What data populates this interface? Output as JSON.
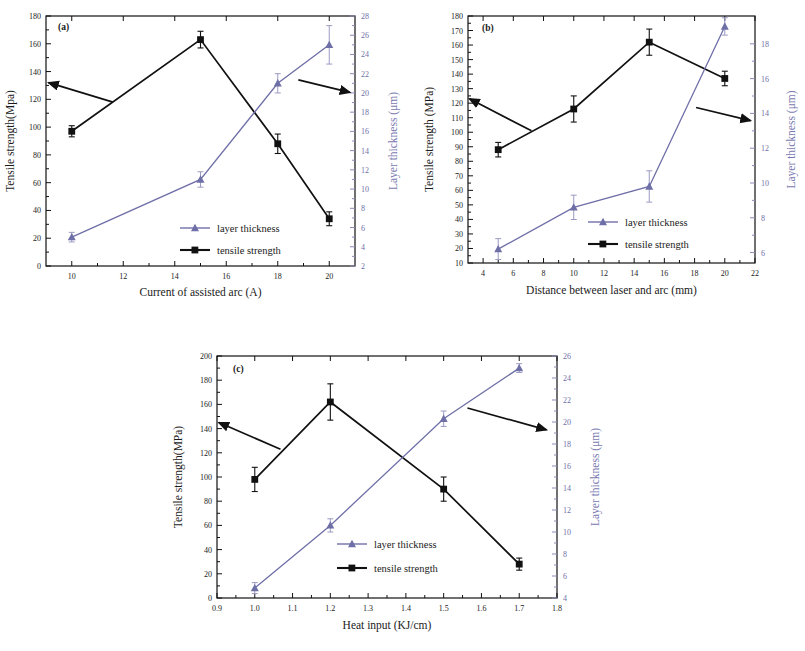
{
  "figure": {
    "panels": [
      "a",
      "b",
      "c"
    ],
    "series_colors": {
      "tensile_strength": "#111111",
      "layer_thickness": "#6f6fa8"
    },
    "legend": {
      "thickness_label": "layer thickness",
      "strength_label": "tensile strength"
    }
  },
  "chart_data": [
    {
      "type": "line",
      "panel_tag": "(a)",
      "title": "",
      "xlabel": "Current of assisted arc (A)",
      "ylabel": "Tensile strength(Mpa)",
      "ylabel_right": "Layer thickness (μm)",
      "xlim": [
        9,
        21
      ],
      "ylim": [
        0,
        180
      ],
      "ylim_right": [
        2,
        28
      ],
      "xticks": [
        10,
        12,
        14,
        16,
        18,
        20
      ],
      "xtick_labels": [
        "10",
        "12",
        "14",
        "16",
        "18",
        "20"
      ],
      "yticks": [
        0,
        20,
        40,
        60,
        80,
        100,
        120,
        140,
        160,
        180
      ],
      "ytick_labels": [
        "0",
        "20",
        "40",
        "60",
        "80",
        "100",
        "120",
        "140",
        "160",
        "180"
      ],
      "yticks_right": [
        2,
        4,
        6,
        8,
        10,
        12,
        14,
        16,
        18,
        20,
        22,
        24,
        26,
        28
      ],
      "ytick_labels_right": [
        "2",
        "4",
        "6",
        "8",
        "10",
        "12",
        "14",
        "16",
        "18",
        "20",
        "22",
        "24",
        "26",
        "28"
      ],
      "grid": false,
      "legend_position": "lower-center-right",
      "x": [
        10,
        15,
        18,
        20
      ],
      "series": [
        {
          "name": "tensile strength",
          "axis": "left",
          "values": [
            97,
            163,
            88,
            34
          ],
          "errors": [
            4,
            6,
            7,
            5
          ]
        },
        {
          "name": "layer thickness",
          "axis": "right",
          "values": [
            5.0,
            11.0,
            21.0,
            25.0
          ],
          "errors": [
            0.5,
            0.8,
            1.0,
            2.0
          ]
        }
      ],
      "annotations": [
        {
          "type": "arrow",
          "points_to": "left-axis",
          "x_from": 11.6,
          "y_from": 118,
          "x_to": 9.1,
          "y_to": 132
        },
        {
          "type": "arrow",
          "points_to": "right-axis",
          "x_from": 18.8,
          "y_from": 134,
          "x_to": 20.8,
          "y_to": 125
        }
      ]
    },
    {
      "type": "line",
      "panel_tag": "(b)",
      "title": "",
      "xlabel": "Distance between laser and arc (mm)",
      "ylabel": "Tensile strength (MPa)",
      "ylabel_right": "Layer thickness (μm)",
      "xlim": [
        3,
        22
      ],
      "ylim": [
        10,
        180
      ],
      "ylim_right": [
        5.4,
        19.6
      ],
      "xticks": [
        4,
        6,
        8,
        10,
        12,
        14,
        16,
        18,
        20,
        22
      ],
      "xtick_labels": [
        "4",
        "6",
        "8",
        "10",
        "12",
        "14",
        "16",
        "18",
        "20",
        "22"
      ],
      "yticks": [
        10,
        20,
        30,
        40,
        50,
        60,
        70,
        80,
        90,
        100,
        110,
        120,
        130,
        140,
        150,
        160,
        170,
        180
      ],
      "ytick_labels": [
        "10",
        "20",
        "30",
        "40",
        "50",
        "60",
        "70",
        "80",
        "90",
        "100",
        "110",
        "120",
        "130",
        "140",
        "150",
        "160",
        "170",
        "180"
      ],
      "yticks_right": [
        6,
        8,
        10,
        12,
        14,
        16,
        18
      ],
      "ytick_labels_right": [
        "6",
        "8",
        "10",
        "12",
        "14",
        "16",
        "18"
      ],
      "grid": false,
      "legend_position": "lower-center-right",
      "x": [
        5,
        10,
        15,
        20
      ],
      "series": [
        {
          "name": "tensile strength",
          "axis": "left",
          "values": [
            88,
            116,
            162,
            137
          ],
          "errors": [
            5,
            9,
            9,
            5
          ]
        },
        {
          "name": "layer thickness",
          "axis": "right",
          "values": [
            6.2,
            8.6,
            9.8,
            19.0
          ],
          "errors": [
            0.6,
            0.7,
            0.9,
            0.5
          ]
        }
      ],
      "annotations": [
        {
          "type": "arrow",
          "points_to": "left-axis",
          "x_from": 7.2,
          "y_from": 101,
          "x_to": 3.1,
          "y_to": 123
        },
        {
          "type": "arrow",
          "points_to": "right-axis",
          "x_from": 18.1,
          "y_from": 117,
          "x_to": 21.7,
          "y_to": 108
        }
      ]
    },
    {
      "type": "line",
      "panel_tag": "(c)",
      "title": "",
      "xlabel": "Heat input (KJ/cm)",
      "ylabel": "Tensile strength(MPa)",
      "ylabel_right": "Layer thickness (μm)",
      "xlim": [
        0.9,
        1.8
      ],
      "ylim": [
        0,
        200
      ],
      "ylim_right": [
        4,
        26
      ],
      "xticks": [
        0.9,
        1.0,
        1.1,
        1.2,
        1.3,
        1.4,
        1.5,
        1.6,
        1.7,
        1.8
      ],
      "xtick_labels": [
        "0.9",
        "1.0",
        "1.1",
        "1.2",
        "1.3",
        "1.4",
        "1.5",
        "1.6",
        "1.7",
        "1.8"
      ],
      "yticks": [
        0,
        20,
        40,
        60,
        80,
        100,
        120,
        140,
        160,
        180,
        200
      ],
      "ytick_labels": [
        "0",
        "20",
        "40",
        "60",
        "80",
        "100",
        "120",
        "140",
        "160",
        "180",
        "200"
      ],
      "yticks_right": [
        4,
        6,
        8,
        10,
        12,
        14,
        16,
        18,
        20,
        22,
        24,
        26
      ],
      "ytick_labels_right": [
        "4",
        "6",
        "8",
        "10",
        "12",
        "14",
        "16",
        "18",
        "20",
        "22",
        "24",
        "26"
      ],
      "grid": false,
      "legend_position": "lower-center",
      "x": [
        1.0,
        1.2,
        1.5,
        1.7
      ],
      "series": [
        {
          "name": "tensile strength",
          "axis": "left",
          "values": [
            98,
            162,
            90,
            28
          ],
          "errors": [
            10,
            15,
            10,
            5
          ]
        },
        {
          "name": "layer thickness",
          "axis": "right",
          "values": [
            4.9,
            10.6,
            20.3,
            24.9
          ],
          "errors": [
            0.5,
            0.6,
            0.7,
            0.4
          ]
        }
      ],
      "annotations": [
        {
          "type": "arrow",
          "points_to": "left-axis",
          "x_from": 1.068,
          "y_from": 123,
          "x_to": 0.905,
          "y_to": 145
        },
        {
          "type": "arrow",
          "points_to": "right-axis",
          "x_from": 1.563,
          "y_from": 157,
          "x_to": 1.772,
          "y_to": 139
        }
      ]
    }
  ]
}
